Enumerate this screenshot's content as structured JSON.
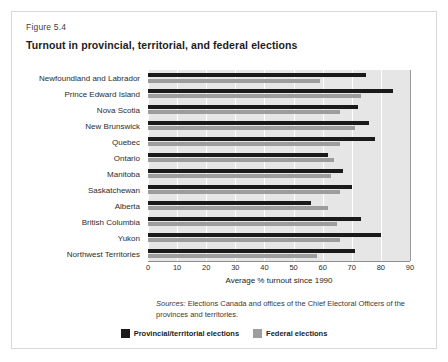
{
  "figure": {
    "number": "Figure 5.4",
    "title": "Turnout in provincial, territorial, and federal elections"
  },
  "source_note": {
    "label": "Sources:",
    "text": " Elections Canada and offices of the Chief Electoral Officers of the provinces and territories."
  },
  "legend": {
    "items": [
      {
        "label": "Provincial/territorial elections",
        "color": "#1a1a1a",
        "key": "provincial"
      },
      {
        "label": "Federal elections",
        "color": "#9d9d9d",
        "key": "federal"
      }
    ]
  },
  "chart_data": {
    "type": "bar",
    "orientation": "horizontal",
    "title": "Turnout in provincial, territorial, and federal elections",
    "xlabel": "Average % turnout since 1990",
    "ylabel": "",
    "xlim": [
      0,
      90
    ],
    "xticks": [
      0,
      10,
      20,
      30,
      40,
      50,
      60,
      70,
      80,
      90
    ],
    "xtick_labels": [
      "0",
      "10",
      "20",
      "30",
      "40",
      "50",
      "60",
      "70",
      "80",
      "90"
    ],
    "grid": true,
    "grid_axis": "x",
    "legend_position": "bottom",
    "categories": [
      "Newfoundland and Labrador",
      "Prince Edward Island",
      "Nova Scotia",
      "New Brunswick",
      "Quebec",
      "Ontario",
      "Manitoba",
      "Saskatchewan",
      "Alberta",
      "British Columbia",
      "Yukon",
      "Northwest Territories"
    ],
    "series": [
      {
        "name": "Provincial/territorial elections",
        "color": "#1a1a1a",
        "values": [
          75,
          84,
          72,
          76,
          78,
          62,
          67,
          70,
          56,
          73,
          80,
          71
        ]
      },
      {
        "name": "Federal elections",
        "color": "#9d9d9d",
        "values": [
          59,
          73,
          66,
          71,
          66,
          64,
          63,
          66,
          62,
          65,
          66,
          58
        ]
      }
    ]
  }
}
